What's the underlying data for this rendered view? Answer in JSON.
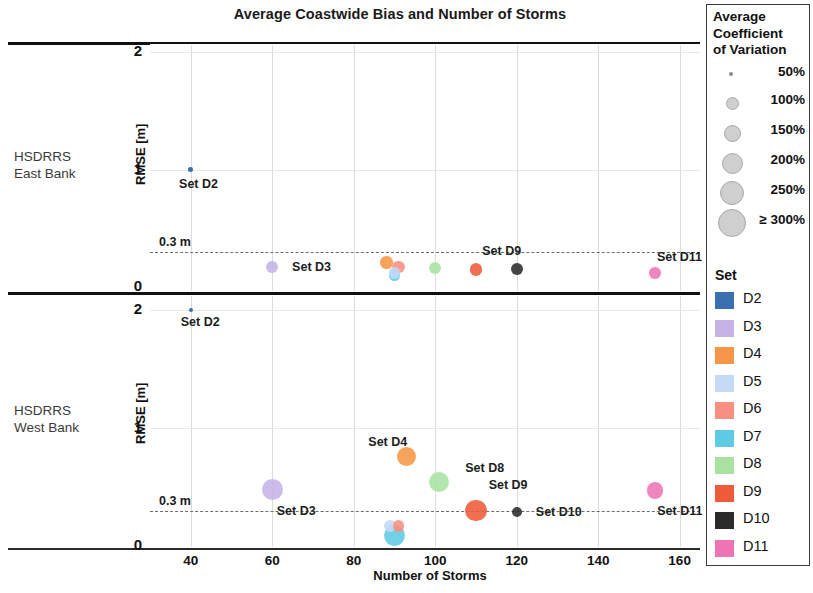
{
  "chart_data": {
    "type": "scatter",
    "title": "Average Coastwide Bias and Number of Storms",
    "xlabel": "Number of Storms",
    "ylabel": "RMSE [m]",
    "xlim": [
      30,
      165
    ],
    "xticks": [
      40,
      60,
      80,
      100,
      120,
      140,
      160
    ],
    "threshold": {
      "value": 0.3,
      "label": "0.3 m",
      "style": "dashed"
    },
    "panels": [
      {
        "name": "HSDRRS East Bank",
        "row_label_line1": "HSDRRS",
        "row_label_line2": "East Bank",
        "ylim": [
          0,
          2.15
        ],
        "yticks": [
          0,
          1,
          2
        ],
        "points": [
          {
            "set": "D2",
            "x": 40,
            "y": 1.0,
            "cv": 55,
            "label": "Set D2",
            "label_dx": -14,
            "label_dy": 14
          },
          {
            "set": "D3",
            "x": 60,
            "y": 0.17,
            "cv": 110,
            "label": "Set D3",
            "label_dx": 14,
            "label_dy": 0
          },
          {
            "set": "D4",
            "x": 88,
            "y": 0.21,
            "cv": 120,
            "label": "",
            "label_dx": 0,
            "label_dy": 0
          },
          {
            "set": "D5",
            "x": 90,
            "y": 0.12,
            "cv": 105,
            "label": "",
            "label_dx": 0,
            "label_dy": 0
          },
          {
            "set": "D6",
            "x": 91,
            "y": 0.17,
            "cv": 115,
            "label": "",
            "label_dx": 0,
            "label_dy": 0
          },
          {
            "set": "D7",
            "x": 90,
            "y": 0.1,
            "cv": 110,
            "label": "",
            "label_dx": 0,
            "label_dy": 0
          },
          {
            "set": "D8",
            "x": 100,
            "y": 0.16,
            "cv": 115,
            "label": "",
            "label_dx": 0,
            "label_dy": 0
          },
          {
            "set": "D9",
            "x": 110,
            "y": 0.15,
            "cv": 120,
            "label": "Set D9",
            "label_dx": 0,
            "label_dy": -18
          },
          {
            "set": "D10",
            "x": 120,
            "y": 0.15,
            "cv": 110,
            "label": "",
            "label_dx": 0,
            "label_dy": 0
          },
          {
            "set": "D11",
            "x": 154,
            "y": 0.12,
            "cv": 105,
            "label": "Set D11",
            "label_dx": -4,
            "label_dy": -16
          }
        ]
      },
      {
        "name": "HSDRRS West Bank",
        "row_label_line1": "HSDRRS",
        "row_label_line2": "West Bank",
        "ylim": [
          0,
          2.15
        ],
        "yticks": [
          0,
          1,
          2
        ],
        "points": [
          {
            "set": "D2",
            "x": 40,
            "y": 2.0,
            "cv": 45,
            "label": "Set D2",
            "label_dx": -12,
            "label_dy": 12
          },
          {
            "set": "D3",
            "x": 60,
            "y": 0.48,
            "cv": 235,
            "label": "Set D3",
            "label_dx": -6,
            "label_dy": 22
          },
          {
            "set": "D4",
            "x": 93,
            "y": 0.76,
            "cv": 205,
            "label": "Set D4",
            "label_dx": -48,
            "label_dy": -14
          },
          {
            "set": "D5",
            "x": 89,
            "y": 0.17,
            "cv": 110,
            "label": "",
            "label_dx": 0,
            "label_dy": 0
          },
          {
            "set": "D6",
            "x": 91,
            "y": 0.17,
            "cv": 105,
            "label": "",
            "label_dx": 0,
            "label_dy": 0
          },
          {
            "set": "D7",
            "x": 90,
            "y": 0.09,
            "cv": 230,
            "label": "",
            "label_dx": 0,
            "label_dy": 0
          },
          {
            "set": "D8",
            "x": 101,
            "y": 0.54,
            "cv": 215,
            "label": "Set D8",
            "label_dx": 16,
            "label_dy": -14
          },
          {
            "set": "D9",
            "x": 110,
            "y": 0.3,
            "cv": 240,
            "label": "Set D9",
            "label_dx": 2,
            "label_dy": -26
          },
          {
            "set": "D10",
            "x": 120,
            "y": 0.29,
            "cv": 95,
            "label": "Set D10",
            "label_dx": 14,
            "label_dy": 0
          },
          {
            "set": "D11",
            "x": 154,
            "y": 0.47,
            "cv": 165,
            "label": "Set D11",
            "label_dx": -6,
            "label_dy": 20
          }
        ]
      }
    ],
    "legend_size": {
      "title_line1": "Average",
      "title_line2": "Coefficient",
      "title_line3": "of Variation",
      "entries": [
        {
          "label": "50%",
          "value": 50,
          "diameter": 4
        },
        {
          "label": "100%",
          "value": 100,
          "diameter": 11
        },
        {
          "label": "150%",
          "value": 150,
          "diameter": 15
        },
        {
          "label": "200%",
          "value": 200,
          "diameter": 19
        },
        {
          "label": "250%",
          "value": 250,
          "diameter": 22
        },
        {
          "label": "≥ 300%",
          "value": 300,
          "diameter": 26
        }
      ]
    },
    "legend_color": {
      "title": "Set",
      "entries": [
        {
          "label": "D2",
          "color": "#3a6fb0"
        },
        {
          "label": "D3",
          "color": "#c5b3e6"
        },
        {
          "label": "D4",
          "color": "#f79646"
        },
        {
          "label": "D5",
          "color": "#c5daf5"
        },
        {
          "label": "D6",
          "color": "#f98e82"
        },
        {
          "label": "D7",
          "color": "#5ecbe4"
        },
        {
          "label": "D8",
          "color": "#a9e2a0"
        },
        {
          "label": "D9",
          "color": "#ed5b38"
        },
        {
          "label": "D10",
          "color": "#2b2b2b"
        },
        {
          "label": "D11",
          "color": "#ef74b4"
        }
      ]
    }
  }
}
